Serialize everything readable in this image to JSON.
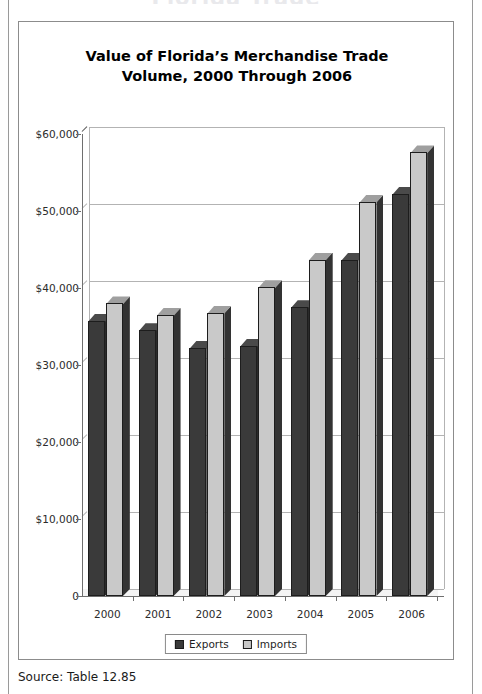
{
  "page": {
    "running_head": "Florida Trade",
    "source_note": "Source: Table 12.85"
  },
  "figure": {
    "title": "Value of Florida’s Merchandise Trade\nVolume, 2000 Through 2006"
  },
  "colors": {
    "exports": "#3a3a3a",
    "exports_side": "#2a2a2a",
    "exports_top": "#4a4a4a",
    "imports": "#c9c9c9",
    "imports_side": "#333333",
    "imports_top": "#9f9f9f",
    "gridline": "#b3b3b3",
    "axis": "#6f6f6f",
    "panel_border": "#8c8c8c"
  },
  "chart_data": {
    "type": "bar",
    "title": "Value of Florida’s Merchandise Trade Volume, 2000 Through 2006",
    "xlabel": "",
    "ylabel": "",
    "categories": [
      "2000",
      "2001",
      "2002",
      "2003",
      "2004",
      "2005",
      "2006"
    ],
    "series": [
      {
        "name": "Exports",
        "values": [
          35700,
          34500,
          32200,
          32500,
          37500,
          43700,
          52200
        ]
      },
      {
        "name": "Imports",
        "values": [
          38000,
          36500,
          36800,
          40100,
          43700,
          51200,
          57600
        ]
      }
    ],
    "ylim": [
      0,
      60000
    ],
    "yticks": [
      0,
      10000,
      20000,
      30000,
      40000,
      50000,
      60000
    ],
    "ytick_labels": [
      "0",
      "$10,000",
      "$20,000",
      "$30,000",
      "$40,000",
      "$50,000",
      "$60,000"
    ],
    "grid": true,
    "legend_position": "bottom",
    "legend_entries": [
      "Exports",
      "Imports"
    ],
    "three_d": true,
    "units": "thousands of dollars"
  }
}
